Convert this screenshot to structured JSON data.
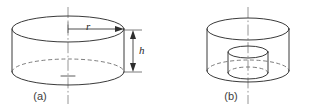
{
  "figure": {
    "kind": "technical-line-diagram",
    "background_color": "#ffffff",
    "line_color": "#3a3a3a",
    "hidden_line_color": "#6e6e6e",
    "axis_color": "#8a8a8a",
    "text_color": "#3d3d3d"
  },
  "panel_a": {
    "caption": "(a)",
    "dimensions": {
      "radius_label": "r",
      "height_label": "h"
    }
  },
  "panel_b": {
    "caption": "(b)"
  }
}
